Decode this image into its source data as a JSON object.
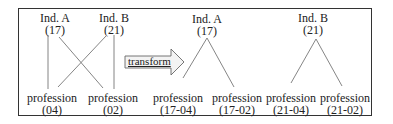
{
  "diagram": {
    "left_tree": {
      "parents": [
        {
          "name": "Ind. A",
          "id": "(17)"
        },
        {
          "name": "Ind. B",
          "id": "(21)"
        }
      ],
      "children": [
        {
          "name": "profession",
          "id": "(04)"
        },
        {
          "name": "profession",
          "id": "(02)"
        }
      ]
    },
    "transform_label": "transform",
    "right_trees": [
      {
        "parent": {
          "name": "Ind. A",
          "id": "(17)"
        },
        "children": [
          {
            "name": "profession",
            "id": "(17-04)"
          },
          {
            "name": "profession",
            "id": "(17-02)"
          }
        ]
      },
      {
        "parent": {
          "name": "Ind. B",
          "id": "(21)"
        },
        "children": [
          {
            "name": "profession",
            "id": "(21-04)"
          },
          {
            "name": "profession",
            "id": "(21-02)"
          }
        ]
      }
    ]
  }
}
